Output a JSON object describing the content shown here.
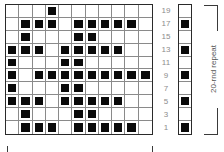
{
  "chart": {
    "columns": 11,
    "rows": 10,
    "row_labels": [
      "19",
      "17",
      "15",
      "13",
      "11",
      "9",
      "7",
      "5",
      "3",
      "1"
    ],
    "filled_color": "#0a0a0a",
    "pattern": [
      [
        0,
        0,
        0,
        1,
        0,
        0,
        0,
        0,
        0,
        0,
        0
      ],
      [
        0,
        1,
        1,
        1,
        0,
        1,
        1,
        1,
        1,
        1,
        0
      ],
      [
        0,
        1,
        0,
        0,
        0,
        1,
        1,
        0,
        0,
        0,
        0
      ],
      [
        1,
        1,
        1,
        0,
        1,
        1,
        1,
        1,
        1,
        0,
        0
      ],
      [
        1,
        0,
        0,
        0,
        1,
        1,
        0,
        0,
        0,
        0,
        0
      ],
      [
        1,
        0,
        1,
        1,
        1,
        1,
        1,
        1,
        1,
        1,
        1
      ],
      [
        1,
        0,
        0,
        0,
        1,
        1,
        0,
        0,
        0,
        0,
        0
      ],
      [
        1,
        1,
        1,
        0,
        1,
        1,
        1,
        1,
        1,
        0,
        0
      ],
      [
        0,
        1,
        0,
        0,
        0,
        1,
        1,
        0,
        0,
        0,
        0
      ],
      [
        0,
        1,
        1,
        1,
        0,
        1,
        1,
        1,
        1,
        1,
        0
      ]
    ]
  },
  "side_chart": {
    "rows": 10,
    "pattern": [
      0,
      1,
      0,
      1,
      0,
      1,
      0,
      1,
      0,
      1
    ]
  },
  "repeat_label": "20-rnd repeat"
}
